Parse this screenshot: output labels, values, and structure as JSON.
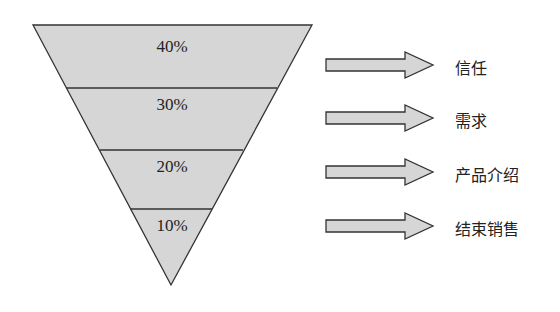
{
  "funnel": {
    "fill": "#d6d6d6",
    "stroke": "#333333",
    "layers": [
      {
        "percent": "40%",
        "stage": "信任"
      },
      {
        "percent": "30%",
        "stage": "需求"
      },
      {
        "percent": "20%",
        "stage": "产品介绍"
      },
      {
        "percent": "10%",
        "stage": "结束销售"
      }
    ]
  }
}
